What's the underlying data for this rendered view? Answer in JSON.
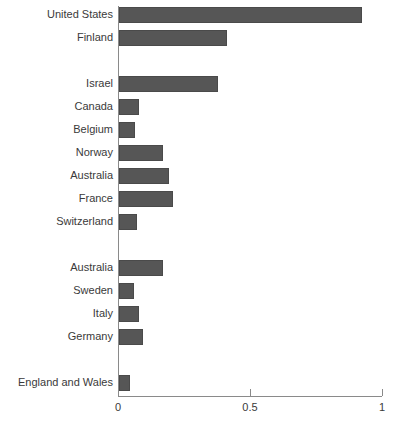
{
  "chart_data": {
    "type": "bar",
    "orientation": "horizontal",
    "title": "",
    "subtitle": "",
    "xlabel": "",
    "ylabel": "",
    "xlim": [
      0,
      1
    ],
    "grid": false,
    "legend": null,
    "xticks": [
      {
        "value": 0,
        "label": "0"
      },
      {
        "value": 0.5,
        "label": "0.5"
      },
      {
        "value": 1,
        "label": "1"
      }
    ],
    "bar_color": "#565656",
    "axis_color": "#8a8a8a",
    "text_color": "#3a3a3a",
    "categories": [
      "United States",
      "Finland",
      "Israel",
      "Canada",
      "Belgium",
      "Norway",
      "Australia",
      "France",
      "Switzerland",
      "Australia",
      "Sweden",
      "Italy",
      "Germany",
      "England and Wales"
    ],
    "values": [
      0.92,
      0.41,
      0.375,
      0.075,
      0.06,
      0.165,
      0.19,
      0.205,
      0.07,
      0.165,
      0.055,
      0.075,
      0.09,
      0.04
    ],
    "rows": [
      {
        "label": "United States",
        "value": 0.92,
        "spacer": false
      },
      {
        "label": "Finland",
        "value": 0.41,
        "spacer": false
      },
      {
        "label": "",
        "value": null,
        "spacer": true
      },
      {
        "label": "Israel",
        "value": 0.375,
        "spacer": false
      },
      {
        "label": "Canada",
        "value": 0.075,
        "spacer": false
      },
      {
        "label": "Belgium",
        "value": 0.06,
        "spacer": false
      },
      {
        "label": "Norway",
        "value": 0.165,
        "spacer": false
      },
      {
        "label": "Australia",
        "value": 0.19,
        "spacer": false
      },
      {
        "label": "France",
        "value": 0.205,
        "spacer": false
      },
      {
        "label": "Switzerland",
        "value": 0.07,
        "spacer": false
      },
      {
        "label": "",
        "value": null,
        "spacer": true
      },
      {
        "label": "Australia",
        "value": 0.165,
        "spacer": false
      },
      {
        "label": "Sweden",
        "value": 0.055,
        "spacer": false
      },
      {
        "label": "Italy",
        "value": 0.075,
        "spacer": false
      },
      {
        "label": "Germany",
        "value": 0.09,
        "spacer": false
      },
      {
        "label": "",
        "value": null,
        "spacer": true
      },
      {
        "label": "England and Wales",
        "value": 0.04,
        "spacer": false
      }
    ]
  }
}
